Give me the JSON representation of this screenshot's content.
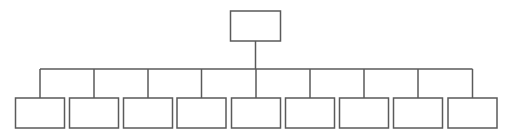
{
  "diagram": {
    "type": "org-chart",
    "stroke_color": "#5a5a5a",
    "fill_color": "#ffffff",
    "root": {
      "label": "",
      "x": 230.5,
      "y": 11,
      "w": 50,
      "h": 30
    },
    "bus_y": 69,
    "child_top": 98,
    "child_w": 49,
    "child_h": 30,
    "children": [
      {
        "label": "",
        "cx": 40
      },
      {
        "label": "",
        "cx": 94
      },
      {
        "label": "",
        "cx": 148
      },
      {
        "label": "",
        "cx": 201.5
      },
      {
        "label": "",
        "cx": 256
      },
      {
        "label": "",
        "cx": 310
      },
      {
        "label": "",
        "cx": 364
      },
      {
        "label": "",
        "cx": 418
      },
      {
        "label": "",
        "cx": 472.5
      }
    ]
  }
}
